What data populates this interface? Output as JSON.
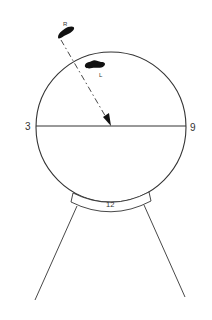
{
  "diagram": {
    "labels": {
      "left": "3",
      "right": "9",
      "bottom": "12",
      "marker_r": "R",
      "marker_l": "L"
    },
    "colors": {
      "stroke": "#333333",
      "blob": "#111111",
      "background": "#ffffff"
    }
  }
}
